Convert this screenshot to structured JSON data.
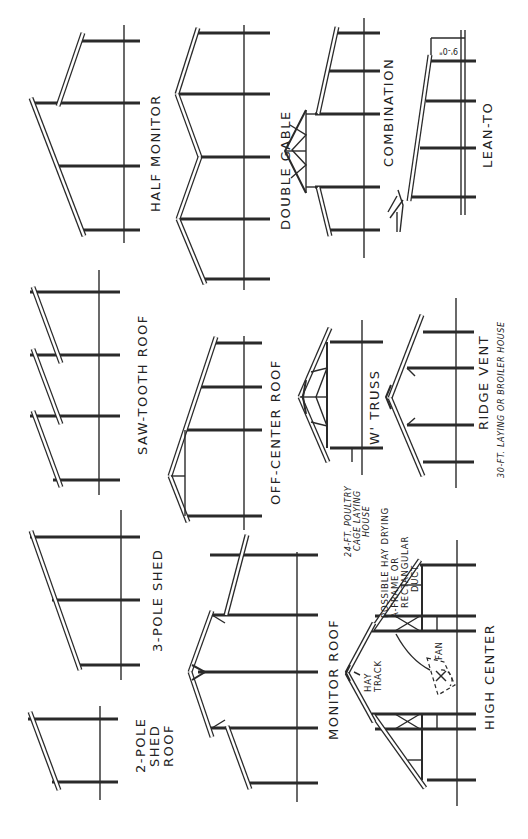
{
  "figure": {
    "orientation": "rotated-90-ccw",
    "colors": {
      "ink": "#2a2a2a",
      "background": "#ffffff"
    },
    "roof_types": [
      {
        "id": "half-monitor",
        "label": "HALF MONITOR"
      },
      {
        "id": "double-gable",
        "label": "DOUBLE GABLE"
      },
      {
        "id": "combination",
        "label": "COMBINATION"
      },
      {
        "id": "lean-to",
        "label": "LEAN-TO",
        "dimension": "9'-0\""
      },
      {
        "id": "saw-tooth",
        "label": "SAW-TOOTH ROOF"
      },
      {
        "id": "off-center",
        "label": "OFF-CENTER ROOF"
      },
      {
        "id": "w-truss",
        "label": "'W' TRUSS",
        "note": [
          "24-FT. POULTRY",
          "CAGE LAYING",
          "HOUSE"
        ]
      },
      {
        "id": "ridge-vent",
        "label": "RIDGE VENT",
        "note": [
          "30-FT. LAYING OR BROILER HOUSE"
        ]
      },
      {
        "id": "three-pole-shed",
        "label": "3-POLE SHED"
      },
      {
        "id": "two-pole-shed",
        "label": [
          "2-POLE",
          "SHED",
          "ROOF"
        ]
      },
      {
        "id": "monitor-roof",
        "label": "MONITOR ROOF"
      },
      {
        "id": "high-center",
        "label": "HIGH CENTER",
        "callouts": {
          "hay_track": [
            "HAY",
            "TRACK"
          ],
          "fan": "FAN",
          "duct": [
            "POSSIBLE HAY DRYING",
            "A-FRAME OR",
            "RECTANGULAR",
            "DUCT"
          ]
        }
      }
    ]
  }
}
